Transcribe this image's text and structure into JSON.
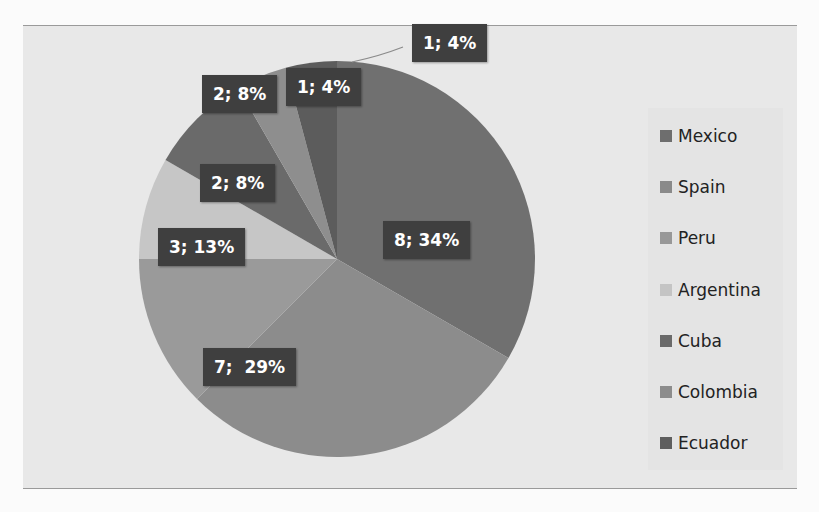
{
  "chart_data": {
    "type": "pie",
    "title": "",
    "categories": [
      "Mexico",
      "Spain",
      "Peru",
      "Argentina",
      "Cuba",
      "Colombia",
      "Ecuador"
    ],
    "values": [
      8,
      7,
      3,
      2,
      2,
      1,
      1
    ],
    "percentages": [
      34,
      29,
      13,
      8,
      8,
      4,
      4
    ],
    "labels": [
      "8; 34%",
      "7;  29%",
      "3; 13%",
      "2; 8%",
      "2; 8%",
      "1; 4%",
      "1; 4%"
    ],
    "colors": [
      "#707070",
      "#8c8c8c",
      "#9a9a9a",
      "#c6c6c6",
      "#6a6a6a",
      "#8e8e8e",
      "#5c5c5c"
    ],
    "start_angle_deg": 0,
    "direction": "clockwise",
    "legend_position": "right"
  },
  "legend": {
    "items": [
      {
        "label": "Mexico",
        "color": "#6e6e6e"
      },
      {
        "label": "Spain",
        "color": "#8a8a8a"
      },
      {
        "label": "Peru",
        "color": "#989898"
      },
      {
        "label": "Argentina",
        "color": "#c4c4c4"
      },
      {
        "label": "Cuba",
        "color": "#6a6a6a"
      },
      {
        "label": "Colombia",
        "color": "#8c8c8c"
      },
      {
        "label": "Ecuador",
        "color": "#5e5e5e"
      }
    ]
  },
  "data_labels": [
    {
      "text": "8; 34%"
    },
    {
      "text": "7;  29%"
    },
    {
      "text": "3; 13%"
    },
    {
      "text": "2; 8%"
    },
    {
      "text": "2; 8%"
    },
    {
      "text": "1; 4%"
    },
    {
      "text": "1; 4%"
    }
  ]
}
